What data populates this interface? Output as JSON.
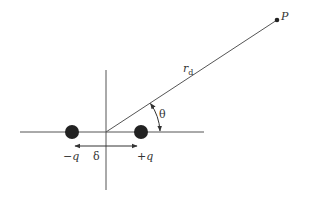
{
  "diagram": {
    "labels": {
      "point": "P",
      "distance_main": "r",
      "distance_sub": "d",
      "angle": "θ",
      "separation": "δ",
      "negative_charge": "−q",
      "positive_charge": "+q"
    },
    "colors": {
      "line": "#555555",
      "charge": "#222222",
      "text": "#333333"
    }
  }
}
